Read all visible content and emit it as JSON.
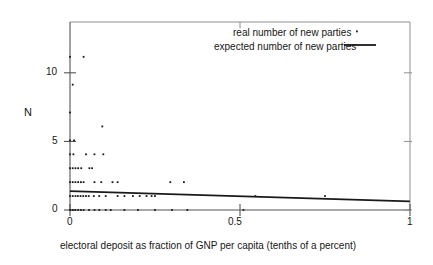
{
  "chart_data": {
    "type": "scatter",
    "title": "",
    "xlabel": "electoral deposit as fraction of GNP per capita (tenths of a percent)",
    "ylabel": "N",
    "xlim": [
      0,
      1
    ],
    "ylim": [
      0,
      13.5
    ],
    "xticks": [
      0,
      0.5,
      1
    ],
    "xticklabels": [
      "0",
      "0.5",
      "1"
    ],
    "yticks": [
      0,
      5,
      10
    ],
    "yticklabels": [
      "0",
      "5",
      "10"
    ],
    "grid": false,
    "legend_position": "top-right",
    "series": [
      {
        "name": "real number of new parties",
        "type": "scatter",
        "marker": "point",
        "color": "#1a1a1a",
        "points": [
          [
            0.0,
            11.0
          ],
          [
            0.04,
            11.0
          ],
          [
            0.008,
            9.0
          ],
          [
            0.0,
            7.0
          ],
          [
            0.095,
            6.0
          ],
          [
            0.0,
            5.0
          ],
          [
            0.012,
            5.0
          ],
          [
            0.0,
            4.0
          ],
          [
            0.01,
            4.0
          ],
          [
            0.047,
            4.0
          ],
          [
            0.072,
            4.0
          ],
          [
            0.098,
            4.0
          ],
          [
            0.0,
            3.0
          ],
          [
            0.008,
            3.0
          ],
          [
            0.016,
            3.0
          ],
          [
            0.024,
            3.0
          ],
          [
            0.033,
            3.0
          ],
          [
            0.057,
            3.0
          ],
          [
            0.065,
            3.0
          ],
          [
            0.0,
            2.0
          ],
          [
            0.008,
            2.0
          ],
          [
            0.016,
            2.0
          ],
          [
            0.024,
            2.0
          ],
          [
            0.032,
            2.0
          ],
          [
            0.04,
            2.0
          ],
          [
            0.072,
            2.0
          ],
          [
            0.092,
            2.0
          ],
          [
            0.125,
            2.0
          ],
          [
            0.14,
            2.0
          ],
          [
            0.295,
            2.0
          ],
          [
            0.335,
            2.0
          ],
          [
            0.0,
            1.0
          ],
          [
            0.008,
            1.0
          ],
          [
            0.016,
            1.0
          ],
          [
            0.023,
            1.0
          ],
          [
            0.031,
            1.0
          ],
          [
            0.039,
            1.0
          ],
          [
            0.047,
            1.0
          ],
          [
            0.055,
            1.0
          ],
          [
            0.07,
            1.0
          ],
          [
            0.086,
            1.0
          ],
          [
            0.105,
            1.0
          ],
          [
            0.14,
            1.0
          ],
          [
            0.16,
            1.0
          ],
          [
            0.185,
            1.0
          ],
          [
            0.205,
            1.0
          ],
          [
            0.225,
            1.0
          ],
          [
            0.24,
            1.0
          ],
          [
            0.25,
            1.0
          ],
          [
            0.545,
            1.0
          ],
          [
            0.75,
            1.0
          ],
          [
            0.0,
            0.0
          ],
          [
            0.008,
            0.0
          ],
          [
            0.016,
            0.0
          ],
          [
            0.024,
            0.0
          ],
          [
            0.032,
            0.0
          ],
          [
            0.04,
            0.0
          ],
          [
            0.056,
            0.0
          ],
          [
            0.072,
            0.0
          ],
          [
            0.086,
            0.0
          ],
          [
            0.105,
            0.0
          ],
          [
            0.12,
            0.0
          ],
          [
            0.16,
            0.0
          ],
          [
            0.2,
            0.0
          ],
          [
            0.25,
            0.0
          ],
          [
            0.3,
            0.0
          ],
          [
            0.345,
            0.0
          ],
          [
            0.51,
            0.0
          ]
        ]
      },
      {
        "name": "expected number of new parties",
        "type": "line",
        "color": "#1a1a1a",
        "x": [
          0,
          1
        ],
        "y": [
          1.35,
          0.62
        ]
      }
    ]
  },
  "legend": {
    "real_label": "real number of new parties",
    "expected_label": "expected number of new parties"
  },
  "axes": {
    "ylabel": "N",
    "xcaption": "electoral deposit as fraction of GNP per capita (tenths of a percent)",
    "ytick_0": "0",
    "ytick_5": "5",
    "ytick_10": "10",
    "xtick_0": "0",
    "xtick_05": "0.5",
    "xtick_1": "1"
  },
  "colors": {
    "ink": "#1a1a1a",
    "frame": "#8a8a8a",
    "background": "#ffffff"
  }
}
